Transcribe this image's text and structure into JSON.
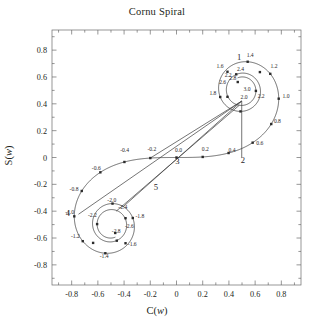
{
  "figure": {
    "title": "Cornu Spiral",
    "width": 314,
    "height": 329
  },
  "chart_data": {
    "type": "line",
    "title": "Cornu Spiral",
    "xlabel": "C(w)",
    "ylabel": "S(w)",
    "xlim": [
      -0.95,
      0.95
    ],
    "ylim": [
      -0.95,
      0.95
    ],
    "grid": false,
    "legend": null,
    "xticks": [
      "-0.8",
      "-0.6",
      "-0.4",
      "-0.2",
      "0",
      "0.2",
      "0.4",
      "0.6",
      "0.8"
    ],
    "xtick_values": [
      -0.8,
      -0.6,
      -0.4,
      -0.2,
      0,
      0.2,
      0.4,
      0.6,
      0.8
    ],
    "yticks": [
      "0.8",
      "0.6",
      "0.4",
      "0.2",
      "0",
      "-0.2",
      "-0.4",
      "-0.6",
      "-0.8"
    ],
    "ytick_values": [
      0.8,
      0.6,
      0.4,
      0.2,
      0,
      -0.2,
      -0.4,
      -0.6,
      -0.8
    ],
    "series": [
      {
        "name": "Cornu spiral (Fresnel C(w), S(w))",
        "parameter": "w",
        "marker": "square",
        "points": [
          {
            "w": -3.0,
            "label": "",
            "C": -0.6057,
            "S": -0.4963
          },
          {
            "w": -2.8,
            "label": "",
            "C": -0.4674,
            "S": -0.5624
          },
          {
            "w": -2.6,
            "label": "",
            "C": -0.3889,
            "S": -0.4524
          },
          {
            "w": -2.4,
            "label": "",
            "C": -0.4557,
            "S": -0.6197
          },
          {
            "w": -2.2,
            "label": "-2.2",
            "C": -0.6363,
            "S": -0.6363
          },
          {
            "w": -2.0,
            "label": "-2.0",
            "C": -0.4883,
            "S": -0.3434
          },
          {
            "w": -1.8,
            "label": "-1.8",
            "C": -0.3336,
            "S": -0.4509
          },
          {
            "w": -1.6,
            "label": "-1.6",
            "C": -0.3889,
            "S": -0.6389
          },
          {
            "w": -1.4,
            "label": "-1.4",
            "C": -0.5431,
            "S": -0.7135
          },
          {
            "w": -1.2,
            "label": "-1.2",
            "C": -0.7154,
            "S": -0.6234
          },
          {
            "w": -1.0,
            "label": "-1.0",
            "C": -0.7799,
            "S": -0.4383
          },
          {
            "w": -0.8,
            "label": "-0.8",
            "C": -0.723,
            "S": -0.2493
          },
          {
            "w": -0.6,
            "label": "-0.6",
            "C": -0.5811,
            "S": -0.1105
          },
          {
            "w": -0.4,
            "label": "-0.4",
            "C": -0.3975,
            "S": -0.0334
          },
          {
            "w": -0.2,
            "label": "-0.2",
            "C": -0.1999,
            "S": -0.0042
          },
          {
            "w": 0.0,
            "label": "0.0",
            "C": 0.0,
            "S": 0.0
          },
          {
            "w": 0.2,
            "label": "0.2",
            "C": 0.1999,
            "S": 0.0042
          },
          {
            "w": 0.4,
            "label": "0.4",
            "C": 0.3975,
            "S": 0.0334
          },
          {
            "w": 0.6,
            "label": "0.6",
            "C": 0.5811,
            "S": 0.1105
          },
          {
            "w": 0.8,
            "label": "0.8",
            "C": 0.723,
            "S": 0.2493
          },
          {
            "w": 1.0,
            "label": "1.0",
            "C": 0.7799,
            "S": 0.4383
          },
          {
            "w": 1.2,
            "label": "1.2",
            "C": 0.7154,
            "S": 0.6234
          },
          {
            "w": 1.4,
            "label": "1.4",
            "C": 0.5431,
            "S": 0.7135
          },
          {
            "w": 1.6,
            "label": "1.6",
            "C": 0.3889,
            "S": 0.6389
          },
          {
            "w": 1.8,
            "label": "1.8",
            "C": 0.3336,
            "S": 0.4509
          },
          {
            "w": 2.0,
            "label": "2.0",
            "C": 0.4883,
            "S": 0.3434
          },
          {
            "w": 2.2,
            "label": "2.2",
            "C": 0.6363,
            "S": 0.6363
          },
          {
            "w": 2.4,
            "label": "2.4",
            "C": 0.4557,
            "S": 0.6197
          },
          {
            "w": 2.6,
            "label": "2.6",
            "C": 0.3889,
            "S": 0.4524
          },
          {
            "w": 2.8,
            "label": "2.8",
            "C": 0.4674,
            "S": 0.5624
          },
          {
            "w": 3.0,
            "label": "3.0",
            "C": 0.6057,
            "S": 0.4963
          }
        ]
      }
    ],
    "chords": [
      {
        "name": "chord-1",
        "from_label": "1",
        "x1": 0.4977,
        "y1": 0.4205,
        "x2": 0.4977,
        "y2": 0.0
      },
      {
        "name": "chord-2",
        "from_label": "2",
        "x1": 0.4977,
        "y1": 0.4205,
        "x2": -0.1999,
        "y2": -0.0042
      },
      {
        "name": "chord-3",
        "from_label": "3",
        "x1": 0.4977,
        "y1": 0.4205,
        "x2": -0.408,
        "y2": -0.368
      },
      {
        "name": "chord-4",
        "from_label": "4",
        "x1": 0.4977,
        "y1": 0.4205,
        "x2": -0.748,
        "y2": -0.423
      },
      {
        "name": "chord-5",
        "from_label": "5",
        "x1": 0.48,
        "y1": 0.39,
        "x2": -0.46,
        "y2": -0.4
      }
    ],
    "annotations": [
      {
        "text": "1",
        "C": 0.478,
        "S": 0.728
      },
      {
        "text": "2",
        "C": 0.506,
        "S": -0.039
      },
      {
        "text": "3",
        "C": 0.006,
        "S": -0.048
      },
      {
        "text": "4",
        "C": -0.828,
        "S": -0.438
      },
      {
        "text": "5",
        "C": -0.158,
        "S": -0.241
      }
    ],
    "point_labels": [
      {
        "text": "1.4",
        "C": 0.562,
        "S": 0.746
      },
      {
        "text": "1.6",
        "C": 0.332,
        "S": 0.668
      },
      {
        "text": "1.2",
        "C": 0.744,
        "S": 0.666
      },
      {
        "text": "2.4",
        "C": 0.488,
        "S": 0.642
      },
      {
        "text": "2.2",
        "C": 0.394,
        "S": 0.601
      },
      {
        "text": "2.6",
        "C": 0.352,
        "S": 0.544
      },
      {
        "text": "2.8",
        "C": 0.43,
        "S": 0.576
      },
      {
        "text": "1.8",
        "C": 0.278,
        "S": 0.462
      },
      {
        "text": "3.0",
        "C": 0.538,
        "S": 0.496
      },
      {
        "text": "2.0",
        "C": 0.516,
        "S": 0.434
      },
      {
        "text": "2.2b",
        "C": 0.646,
        "S": 0.442
      },
      {
        "text": "1.0",
        "C": 0.836,
        "S": 0.442
      },
      {
        "text": "0.8",
        "C": 0.77,
        "S": 0.258
      },
      {
        "text": "0.6",
        "C": 0.636,
        "S": 0.094
      },
      {
        "text": "0.4",
        "C": 0.424,
        "S": 0.038
      },
      {
        "text": "0.2",
        "C": 0.22,
        "S": 0.046
      },
      {
        "text": "0.0",
        "C": 0.016,
        "S": 0.042
      },
      {
        "text": "-0.2",
        "C": -0.188,
        "S": 0.046
      },
      {
        "text": "-0.4",
        "C": -0.396,
        "S": 0.038
      },
      {
        "text": "-0.6",
        "C": -0.612,
        "S": -0.09
      },
      {
        "text": "-0.8",
        "C": -0.782,
        "S": -0.248
      },
      {
        "text": "-1.0",
        "C": -0.816,
        "S": -0.42
      },
      {
        "text": "-1.2",
        "C": -0.772,
        "S": -0.6
      },
      {
        "text": "-1.4",
        "C": -0.552,
        "S": -0.746
      },
      {
        "text": "-1.6",
        "C": -0.338,
        "S": -0.66
      },
      {
        "text": "-1.8",
        "C": -0.28,
        "S": -0.454
      },
      {
        "text": "-2.0",
        "C": -0.494,
        "S": -0.332
      },
      {
        "text": "-2.2",
        "C": -0.642,
        "S": -0.444
      },
      {
        "text": "-2.4",
        "C": -0.41,
        "S": -0.38
      },
      {
        "text": "-2.6",
        "C": -0.36,
        "S": -0.522
      },
      {
        "text": "-2.8",
        "C": -0.46,
        "S": -0.562
      }
    ]
  },
  "colors": {
    "curve": "#3a3a3a",
    "frame": "#6a6a6a",
    "text": "#231f20",
    "background": "#ffffff"
  }
}
